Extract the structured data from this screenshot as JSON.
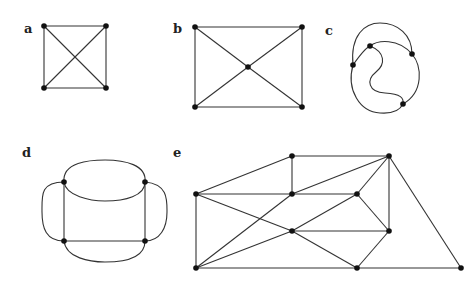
{
  "figure": {
    "panels": [
      {
        "id": "a",
        "label": "a",
        "label_pos": [
          24,
          33
        ],
        "vertices": [
          [
            44,
            26
          ],
          [
            106,
            26
          ],
          [
            44,
            88
          ],
          [
            106,
            88
          ]
        ],
        "edges": [
          [
            0,
            1
          ],
          [
            0,
            2
          ],
          [
            1,
            3
          ],
          [
            2,
            3
          ],
          [
            0,
            3
          ],
          [
            1,
            2
          ]
        ]
      },
      {
        "id": "b",
        "label": "b",
        "label_pos": [
          173,
          33
        ],
        "vertices": [
          [
            195,
            27
          ],
          [
            302,
            27
          ],
          [
            248,
            67
          ],
          [
            195,
            107
          ],
          [
            302,
            107
          ]
        ],
        "edges": [
          [
            0,
            1
          ],
          [
            0,
            3
          ],
          [
            1,
            4
          ],
          [
            3,
            4
          ],
          [
            0,
            2
          ],
          [
            2,
            4
          ],
          [
            1,
            2
          ],
          [
            2,
            3
          ]
        ]
      },
      {
        "id": "c",
        "label": "c",
        "label_pos": [
          325,
          35
        ],
        "vertices": [
          [
            370,
            46
          ],
          [
            412,
            54
          ],
          [
            353,
            65
          ],
          [
            403,
            104
          ]
        ]
      },
      {
        "id": "d",
        "label": "d",
        "label_pos": [
          22,
          157
        ],
        "vertices": [
          [
            64,
            182
          ],
          [
            145,
            182
          ],
          [
            64,
            241
          ],
          [
            145,
            241
          ]
        ]
      },
      {
        "id": "e",
        "label": "e",
        "label_pos": [
          173,
          157
        ],
        "vertices": [
          [
            196,
            194
          ],
          [
            292,
            156
          ],
          [
            292,
            194
          ],
          [
            292,
            231
          ],
          [
            196,
            268
          ],
          [
            389,
            156
          ],
          [
            357,
            194
          ],
          [
            389,
            231
          ],
          [
            357,
            268
          ],
          [
            461,
            268
          ]
        ],
        "edges": [
          [
            0,
            1
          ],
          [
            1,
            2
          ],
          [
            0,
            2
          ],
          [
            2,
            6
          ],
          [
            2,
            5
          ],
          [
            0,
            3
          ],
          [
            3,
            8
          ],
          [
            0,
            4
          ],
          [
            4,
            2
          ],
          [
            4,
            3
          ],
          [
            3,
            6
          ],
          [
            3,
            7
          ],
          [
            4,
            8
          ],
          [
            8,
            9
          ],
          [
            6,
            5
          ],
          [
            6,
            7
          ],
          [
            5,
            7
          ],
          [
            5,
            9
          ],
          [
            7,
            8
          ],
          [
            1,
            5
          ]
        ]
      }
    ]
  }
}
